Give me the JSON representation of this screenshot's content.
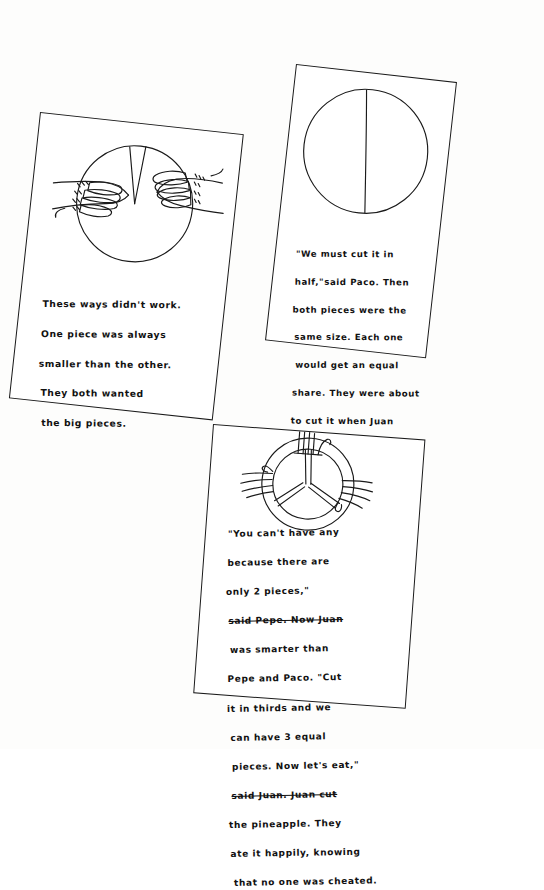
{
  "page": {
    "kind": "hand-drawn-story-worksheet",
    "background_color": "#fdfdfc",
    "ink_color": "#111111"
  },
  "panels": [
    {
      "id": "panel-1",
      "name": "panel-unequal-halves",
      "illustration": {
        "name": "pineapple-circle-two-hands",
        "shape": "circle",
        "cut_lines": 2,
        "hands": 2,
        "hand_positions": [
          "left",
          "right"
        ],
        "description": "circle with a narrow wedge cut at the top, two hands grabbing from left and right"
      },
      "caption_lines": [
        "These ways didn't work.",
        "One piece was always",
        "smaller than the other.",
        "They both wanted",
        "the big pieces."
      ],
      "caption": "These ways didn't work. One piece was always smaller than the other. They both wanted the big pieces."
    },
    {
      "id": "panel-2",
      "name": "panel-equal-halves",
      "illustration": {
        "name": "pineapple-circle-halved",
        "shape": "circle",
        "cut_lines": 1,
        "hands": 0,
        "hand_positions": [],
        "description": "circle divided in half by a single near-vertical line"
      },
      "caption_lines": [
        "\"We must cut it in",
        "half,\"said Paco. Then",
        "both pieces were the",
        "same size. Each one",
        "would get an equal",
        "share. They were about",
        "to cut it when Juan",
        "came in and asked for",
        "a piece."
      ],
      "caption": "\"We must cut it in half,\" said Paco. Then both pieces were the same size. Each one would get an equal share. They were about to cut it when Juan came in and asked for a piece."
    },
    {
      "id": "panel-3",
      "name": "panel-equal-thirds",
      "illustration": {
        "name": "pineapple-circle-thirds-three-hands",
        "shape": "circle-with-inner-circle",
        "cut_lines": 3,
        "hands": 3,
        "hand_positions": [
          "top",
          "left",
          "right"
        ],
        "description": "circle with inner circle divided into three equal wedges, three hands reaching in from top, left and right"
      },
      "caption_lines": [
        "\"You can't have any",
        "because there are",
        "only 2   pieces,\"",
        "said Pepe. Now Juan",
        "was smarter than",
        "Pepe and Paco. \"Cut",
        "it in  thirds and we",
        "can have 3 equal",
        "pieces. Now let's eat,\"",
        "said Juan. Juan cut",
        "the pineapple. They",
        "ate it happily, knowing",
        "that no one was cheated."
      ],
      "struck_line_indices": [
        3,
        9
      ],
      "caption": "\"You can't have any because there are only 2 pieces,\" said Pepe. Now Juan was smarter than Pepe and Paco. \"Cut it in thirds and we can have 3 equal pieces. Now let's eat,\" said Juan. Juan cut the pineapple. They ate it happily, knowing that no one was cheated."
    }
  ]
}
